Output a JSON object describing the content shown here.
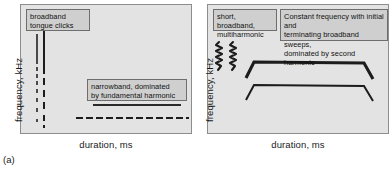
{
  "figure": {
    "panel_marker": "(a)",
    "panels": [
      {
        "id": "left",
        "axes": {
          "ylabel": "frequency, kHz",
          "xlabel": "duration, ms"
        },
        "callouts": [
          {
            "name": "broadband-tongue-clicks",
            "lines": [
              "broadband",
              "tongue clicks"
            ]
          },
          {
            "name": "narrowband-fundamental",
            "lines": [
              "narrowband, dominated",
              "by fundamental harmonic"
            ]
          }
        ],
        "traces": [
          {
            "name": "click-train-a",
            "type": "vertical-broadband-click",
            "description": "solid upper segment continuing as broken dashes downward"
          },
          {
            "name": "click-train-b",
            "type": "vertical-broadband-click",
            "description": "solid upper segment continuing as broken dashes downward"
          },
          {
            "name": "narrowband-solid-tone",
            "type": "horizontal-constant-frequency",
            "description": "solid horizontal band, fundamental harmonic"
          },
          {
            "name": "narrowband-dashed-tone",
            "type": "horizontal-constant-frequency",
            "description": "dashed horizontal band below the solid tone"
          }
        ]
      },
      {
        "id": "right",
        "axes": {
          "ylabel": "frequency, kHz",
          "xlabel": "duration, ms"
        },
        "callouts": [
          {
            "name": "short-broadband-multiharmonic",
            "lines": [
              "short, broadband,",
              "multiharmonic"
            ]
          },
          {
            "name": "constant-frequency-sweeps",
            "lines": [
              "Constant frequency with initial and",
              "terminating broadband sweeps,",
              "dominated by second harmonic"
            ]
          }
        ],
        "traces": [
          {
            "name": "multiharmonic-squiggle-a",
            "type": "vertical-zigzag",
            "description": "short vertical wavy multiharmonic burst"
          },
          {
            "name": "multiharmonic-squiggle-b",
            "type": "vertical-zigzag",
            "description": "short vertical wavy multiharmonic burst"
          },
          {
            "name": "second-harmonic-contour",
            "type": "constant-frequency-with-sweeps",
            "description": "thick upper horizontal contour with downward broadband sweeps at onset and offset"
          },
          {
            "name": "fundamental-harmonic-contour",
            "type": "constant-frequency-with-sweeps",
            "description": "thinner lower horizontal contour with downward broadband sweeps at onset and offset"
          }
        ]
      }
    ],
    "colors": {
      "panel_background": "#e3e3e3",
      "panel_border": "#8d8d8d",
      "callout_background": "#cfcfcf",
      "callout_border": "#6e6e6e",
      "trace_dark": "#1c1c1c",
      "trace_gray": "#4a4a4a",
      "page_background": "#ffffff"
    }
  }
}
